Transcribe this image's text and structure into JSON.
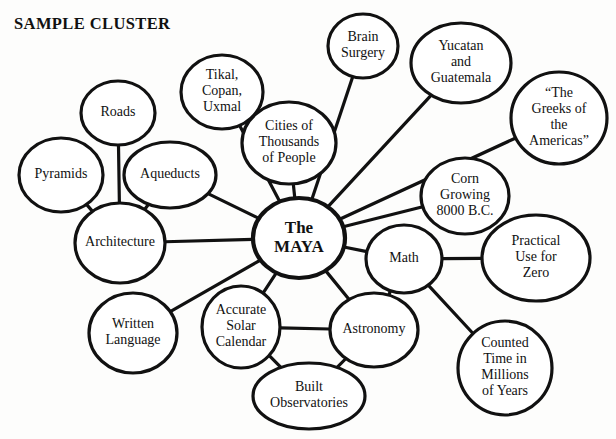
{
  "page": {
    "width": 616,
    "height": 439,
    "background_color": "#fdfdfc",
    "ink_color": "#111111"
  },
  "title": {
    "text": "SAMPLE CLUSTER",
    "x": 14,
    "y": 14
  },
  "bottom_cut_label": {
    "text": "",
    "visible": false
  },
  "chart_data": {
    "type": "diagram",
    "diagram_type": "cluster-map",
    "title": "SAMPLE CLUSTER",
    "center_node": "The MAYA",
    "node_count": 17,
    "edge_count": 20,
    "nodes": [
      {
        "id": "maya",
        "label": "The MAYA",
        "lines": [
          "The",
          "MAYA"
        ],
        "cx": 299,
        "cy": 238,
        "rx": 46,
        "ry": 40,
        "font_size": 17,
        "bold": true,
        "stroke_width": 4.2,
        "line_height": 19
      },
      {
        "id": "tikal",
        "label": "Tikal, Copan, Uxmal",
        "lines": [
          "Tikal,",
          "Copan,",
          "Uxmal"
        ],
        "cx": 222,
        "cy": 92,
        "rx": 41,
        "ry": 37,
        "font_size": 14,
        "bold": false,
        "stroke_width": 3.2,
        "line_height": 16
      },
      {
        "id": "brain",
        "label": "Brain Surgery",
        "lines": [
          "Brain",
          "Surgery"
        ],
        "cx": 363,
        "cy": 46,
        "rx": 35,
        "ry": 32,
        "font_size": 14,
        "bold": false,
        "stroke_width": 3.2,
        "line_height": 16
      },
      {
        "id": "yucatan",
        "label": "Yucatan and Guatemala",
        "lines": [
          "Yucatan",
          "and",
          "Guatemala"
        ],
        "cx": 461,
        "cy": 63,
        "rx": 50,
        "ry": 40,
        "font_size": 14,
        "bold": false,
        "stroke_width": 3.2,
        "line_height": 16
      },
      {
        "id": "greeks",
        "label": "“The Greeks of the Americas”",
        "lines": [
          "“The",
          "Greeks of",
          "the",
          "Americas”"
        ],
        "cx": 559,
        "cy": 118,
        "rx": 48,
        "ry": 46,
        "font_size": 14,
        "bold": false,
        "stroke_width": 3.2,
        "line_height": 16
      },
      {
        "id": "cities",
        "label": "Cities of Thousands of People",
        "lines": [
          "Cities of",
          "Thousands",
          "of People"
        ],
        "cx": 289,
        "cy": 143,
        "rx": 47,
        "ry": 41,
        "font_size": 14,
        "bold": false,
        "stroke_width": 3.2,
        "line_height": 16
      },
      {
        "id": "roads",
        "label": "Roads",
        "lines": [
          "Roads"
        ],
        "cx": 118,
        "cy": 113,
        "rx": 37,
        "ry": 32,
        "font_size": 14,
        "bold": false,
        "stroke_width": 3.2,
        "line_height": 16
      },
      {
        "id": "pyramids",
        "label": "Pyramids",
        "lines": [
          "Pyramids"
        ],
        "cx": 61,
        "cy": 175,
        "rx": 42,
        "ry": 37,
        "font_size": 14,
        "bold": false,
        "stroke_width": 3.2,
        "line_height": 16
      },
      {
        "id": "aqueducts",
        "label": "Aqueducts",
        "lines": [
          "Aqueducts"
        ],
        "cx": 170,
        "cy": 175,
        "rx": 46,
        "ry": 33,
        "font_size": 14,
        "bold": false,
        "stroke_width": 3.2,
        "line_height": 16
      },
      {
        "id": "architecture",
        "label": "Architecture",
        "lines": [
          "Architecture"
        ],
        "cx": 120,
        "cy": 243,
        "rx": 45,
        "ry": 40,
        "font_size": 14,
        "bold": false,
        "stroke_width": 3.2,
        "line_height": 16
      },
      {
        "id": "corn",
        "label": "Corn Growing 8000 B.C.",
        "lines": [
          "Corn",
          "Growing",
          "8000 B.C."
        ],
        "cx": 465,
        "cy": 196,
        "rx": 44,
        "ry": 38,
        "font_size": 14,
        "bold": false,
        "stroke_width": 3.2,
        "line_height": 16
      },
      {
        "id": "zero",
        "label": "Practical Use for Zero",
        "lines": [
          "Practical",
          "Use for",
          "Zero"
        ],
        "cx": 536,
        "cy": 258,
        "rx": 54,
        "ry": 43,
        "font_size": 14,
        "bold": false,
        "stroke_width": 3.2,
        "line_height": 16
      },
      {
        "id": "math",
        "label": "Math",
        "lines": [
          "Math"
        ],
        "cx": 404,
        "cy": 259,
        "rx": 38,
        "ry": 34,
        "font_size": 14,
        "bold": false,
        "stroke_width": 3.2,
        "line_height": 16
      },
      {
        "id": "counted",
        "label": "Counted Time in Millions of Years",
        "lines": [
          "Counted",
          "Time in",
          "Millions",
          "of Years"
        ],
        "cx": 505,
        "cy": 368,
        "rx": 47,
        "ry": 47,
        "font_size": 14,
        "bold": false,
        "stroke_width": 3.2,
        "line_height": 16
      },
      {
        "id": "written",
        "label": "Written Language",
        "lines": [
          "Written",
          "Language"
        ],
        "cx": 133,
        "cy": 333,
        "rx": 44,
        "ry": 40,
        "font_size": 14,
        "bold": false,
        "stroke_width": 3.2,
        "line_height": 16
      },
      {
        "id": "calendar",
        "label": "Accurate Solar Calendar",
        "lines": [
          "Accurate",
          "Solar",
          "Calendar"
        ],
        "cx": 241,
        "cy": 327,
        "rx": 39,
        "ry": 41,
        "font_size": 14,
        "bold": false,
        "stroke_width": 3.2,
        "line_height": 16
      },
      {
        "id": "astronomy",
        "label": "Astronomy",
        "lines": [
          "Astronomy"
        ],
        "cx": 374,
        "cy": 330,
        "rx": 44,
        "ry": 37,
        "font_size": 14,
        "bold": false,
        "stroke_width": 3.2,
        "line_height": 16
      },
      {
        "id": "observatories",
        "label": "Built Observatories",
        "lines": [
          "Built",
          "Observatories"
        ],
        "cx": 309,
        "cy": 396,
        "rx": 56,
        "ry": 33,
        "font_size": 14,
        "bold": false,
        "stroke_width": 3.2,
        "line_height": 16
      }
    ],
    "edges": [
      {
        "from": "maya",
        "to": "tikal",
        "width": 3.2
      },
      {
        "from": "maya",
        "to": "brain",
        "width": 3.2
      },
      {
        "from": "maya",
        "to": "yucatan",
        "width": 3.2
      },
      {
        "from": "maya",
        "to": "greeks",
        "width": 3.2
      },
      {
        "from": "maya",
        "to": "cities",
        "width": 3.2
      },
      {
        "from": "maya",
        "to": "aqueducts",
        "width": 3.2
      },
      {
        "from": "maya",
        "to": "architecture",
        "width": 3.2
      },
      {
        "from": "maya",
        "to": "corn",
        "width": 3.2
      },
      {
        "from": "maya",
        "to": "math",
        "width": 3.2
      },
      {
        "from": "maya",
        "to": "astronomy",
        "width": 3.2
      },
      {
        "from": "maya",
        "to": "calendar",
        "width": 3.2
      },
      {
        "from": "maya",
        "to": "written",
        "width": 3.2
      },
      {
        "from": "tikal",
        "to": "cities",
        "width": 3.2
      },
      {
        "from": "roads",
        "to": "architecture",
        "width": 3.2
      },
      {
        "from": "pyramids",
        "to": "architecture",
        "width": 3.2
      },
      {
        "from": "aqueducts",
        "to": "architecture",
        "width": 3.2
      },
      {
        "from": "math",
        "to": "zero",
        "width": 3.2
      },
      {
        "from": "math",
        "to": "counted",
        "width": 3.2
      },
      {
        "from": "math",
        "to": "astronomy",
        "width": 3.2
      },
      {
        "from": "astronomy",
        "to": "calendar",
        "width": 3.2
      },
      {
        "from": "astronomy",
        "to": "observatories",
        "width": 3.2
      },
      {
        "from": "calendar",
        "to": "observatories",
        "width": 3.2
      }
    ]
  }
}
